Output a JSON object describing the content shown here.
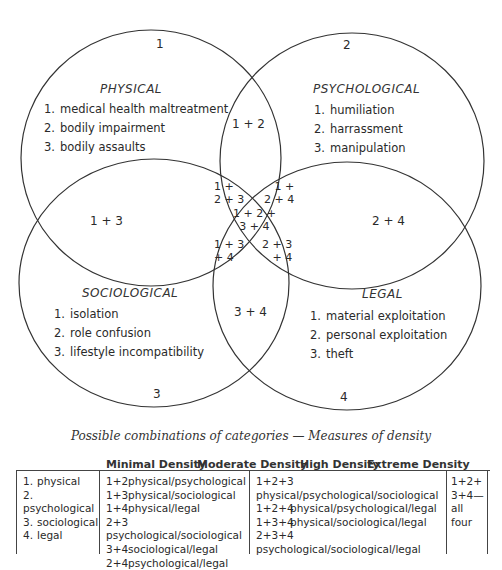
{
  "diagram": {
    "caption": "Possible combinations of categories — Measures of density",
    "circles": [
      {
        "id": "1",
        "number_label": "1",
        "title": "PHYSICAL",
        "items": [
          "1.",
          "medical health maltreatment",
          "2.",
          "bodily impairment",
          "3.",
          "bodily assaults"
        ]
      },
      {
        "id": "2",
        "number_label": "2",
        "title": "PSYCHOLOGICAL",
        "items": [
          "1.",
          "humiliation",
          "2.",
          "harrassment",
          "3.",
          "manipulation"
        ]
      },
      {
        "id": "3",
        "number_label": "3",
        "title": "SOCIOLOGICAL",
        "items": [
          "1.",
          "isolation",
          "2.",
          "role confusion",
          "3.",
          "lifestyle incompatibility"
        ]
      },
      {
        "id": "4",
        "number_label": "4",
        "title": "LEGAL",
        "items": [
          "1.",
          "material exploitation",
          "2.",
          "personal exploitation",
          "3.",
          "theft"
        ]
      }
    ],
    "overlaps": {
      "o12": "1 + 2",
      "o13": "1 + 3",
      "o24": "2 + 4",
      "o34": "3 + 4",
      "o123_a": "1 +",
      "o123_b": "2 + 3",
      "o124_a": "1 +",
      "o124_b": "2 + 4",
      "o1234_a": "1 + 2 +",
      "o1234_b": "3 + 4",
      "o134_a": "1 + 3",
      "o134_b": "+ 4",
      "o234_a": "2 + 3",
      "o234_b": "+ 4"
    }
  },
  "density_table": {
    "headers": {
      "minimal": "Minimal Density",
      "moderate": "Moderate Density",
      "high": "High Density",
      "extreme": "Extreme Density"
    },
    "categories": [
      {
        "n": "1.",
        "label": "physical"
      },
      {
        "n": "2.",
        "label": "psychological"
      },
      {
        "n": "3.",
        "label": "sociological"
      },
      {
        "n": "4.",
        "label": "legal"
      }
    ],
    "moderate_rows": [
      {
        "code": "1+2",
        "label": "physical/psychological"
      },
      {
        "code": "1+3",
        "label": "physical/sociological"
      },
      {
        "code": "1+4",
        "label": "physical/legal"
      },
      {
        "code": "2+3",
        "label": "psychological/sociological"
      },
      {
        "code": "3+4",
        "label": "sociological/legal"
      },
      {
        "code": "2+4",
        "label": "psychological/legal"
      }
    ],
    "high_rows": [
      {
        "code": "1+2+3",
        "label": "physical/psychological/sociological"
      },
      {
        "code": "1+2+4",
        "label": "physical/psychological/legal"
      },
      {
        "code": "1+3+4",
        "label": "physical/sociological/legal"
      },
      {
        "code": "2+3+4",
        "label": "psychological/sociological/legal"
      }
    ],
    "extreme_lines": [
      "1+2+",
      "3+4—",
      "all",
      "four"
    ]
  }
}
